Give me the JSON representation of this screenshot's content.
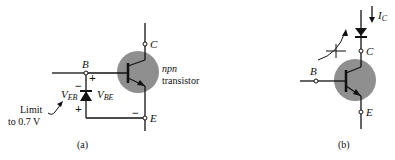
{
  "figure_a": {
    "caption": "(a)",
    "terminal_c": "C",
    "terminal_b": "B",
    "terminal_e": "E",
    "transistor_type": "npn",
    "transistor_word": "transistor",
    "v_eb_main": "V",
    "v_eb_sub": "EB",
    "v_be_main": "V",
    "v_be_sub": "BE",
    "plus_top": "+",
    "minus_top": "−",
    "plus_bottom": "+",
    "minus_right": "−",
    "limit_line1": "Limit",
    "limit_line2": "to 0.7 V"
  },
  "figure_b": {
    "caption": "(b)",
    "terminal_c": "C",
    "terminal_b": "B",
    "terminal_e": "E",
    "current_main": "I",
    "current_sub": "C"
  },
  "colors": {
    "circle_fill": "#8f8f8f",
    "line": "#111111"
  }
}
